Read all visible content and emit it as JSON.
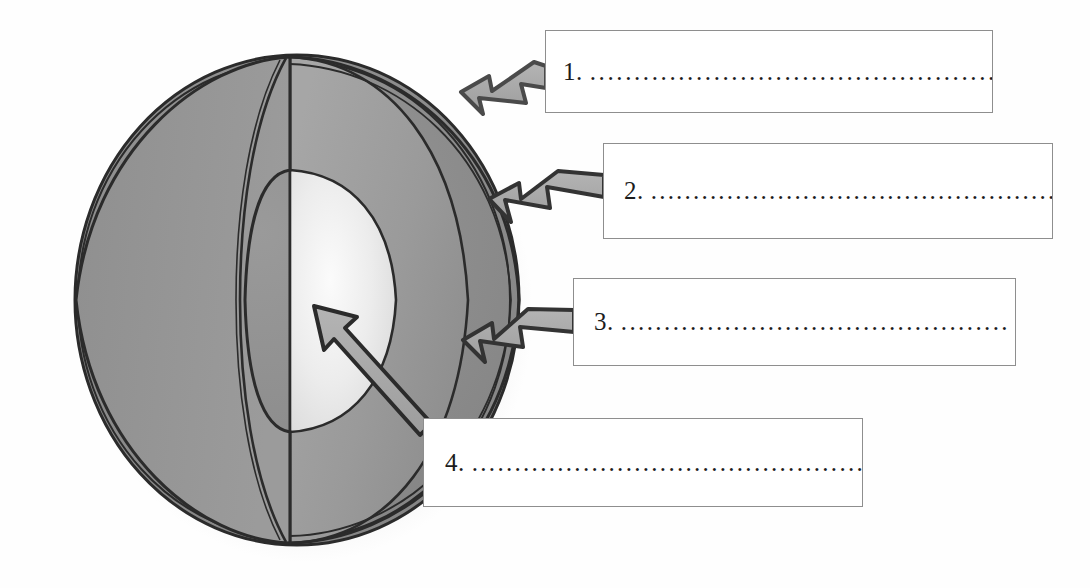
{
  "diagram": {
    "background_color": "#fefefe"
  },
  "figure": {
    "name": "cutaway-sphere",
    "center_x": 297,
    "center_y": 300,
    "radius_x": 222,
    "radius_y": 245,
    "layers": [
      {
        "name": "outer-shell",
        "fill": "#8c8c8c",
        "stroke": "#2b2b2b"
      },
      {
        "name": "middle-layer",
        "fill": "#9d9d9d",
        "stroke": "#2b2b2b"
      },
      {
        "name": "inner-core",
        "fill": "#efefef",
        "stroke": "#2b2b2b"
      }
    ],
    "stroke_color": "#2b2b2b",
    "shadow_color": "#d8d8d8"
  },
  "arrows": [
    {
      "name": "arrow-1",
      "style": "block",
      "direction": "left",
      "points_to": "outer-shell",
      "fill": "#a8a8a8",
      "stroke": "#4a4a4a"
    },
    {
      "name": "arrow-2",
      "style": "block",
      "direction": "left",
      "points_to": "outer-shell",
      "fill": "#a8a8a8",
      "stroke": "#333333"
    },
    {
      "name": "arrow-3",
      "style": "block",
      "direction": "left",
      "points_to": "middle-layer",
      "fill": "#a8a8a8",
      "stroke": "#333333"
    },
    {
      "name": "arrow-4",
      "style": "thin-diagonal",
      "direction": "up-left",
      "points_to": "inner-core",
      "fill": "#a8a8a8",
      "stroke": "#2b2b2b"
    }
  ],
  "labels": [
    {
      "number": "1.",
      "dots": "................................................",
      "box_name": "label-box-1"
    },
    {
      "number": "2.",
      "dots": "..................................................",
      "box_name": "label-box-2"
    },
    {
      "number": "3.",
      "dots": ".............................................",
      "box_name": "label-box-3"
    },
    {
      "number": "4.",
      "dots": "...............................................",
      "box_name": "label-box-4"
    }
  ]
}
